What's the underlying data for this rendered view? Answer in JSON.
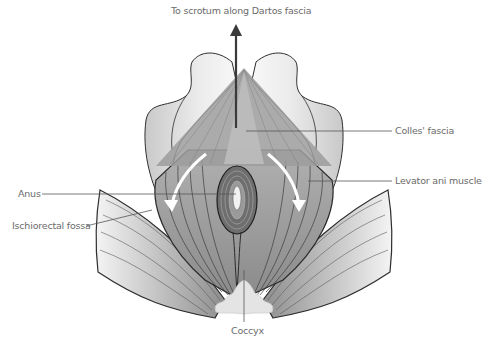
{
  "figure": {
    "type": "anatomical-diagram"
  },
  "labels": {
    "top": "To scrotum along Dartos fascia",
    "colles": "Colles' fascia",
    "levator": "Levator ani muscle",
    "anus": "Anus",
    "ischiorectal": "Ischiorectal fossa",
    "coccyx": "Coccyx"
  },
  "colors": {
    "outline": "#3a3a3a",
    "fascia_fill": "#a8a8a8",
    "muscle_fill": "#9a9a9a",
    "bone_fill": "#d9d9d9",
    "leader_line": "#555555",
    "label_text": "#6b6b6b"
  }
}
